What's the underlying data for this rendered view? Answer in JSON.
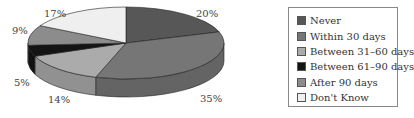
{
  "chart_data": {
    "type": "pie",
    "title": "",
    "categories": [
      "Never",
      "Within 30 days",
      "Between 31–60 days",
      "Between 61–90 days",
      "After 90 days",
      "Don't Know"
    ],
    "values": [
      20,
      35,
      14,
      5,
      9,
      17
    ],
    "colors": [
      "#575757",
      "#767676",
      "#ababab",
      "#141414",
      "#8c8c8c",
      "#efefef"
    ],
    "legend_position": "right",
    "style": "3d"
  },
  "labels": {
    "never": "20%",
    "within30": "35%",
    "b3160": "14%",
    "b6190": "5%",
    "after90": "9%",
    "dontknow": "17%"
  },
  "legend": {
    "items": [
      {
        "label": "Never",
        "color": "#575757"
      },
      {
        "label": "Within 30 days",
        "color": "#767676"
      },
      {
        "label": "Between 31–60 days",
        "color": "#ababab"
      },
      {
        "label": "Between 61–90 days",
        "color": "#141414"
      },
      {
        "label": "After 90 days",
        "color": "#8c8c8c"
      },
      {
        "label": "Don't Know",
        "color": "#efefef"
      }
    ]
  }
}
